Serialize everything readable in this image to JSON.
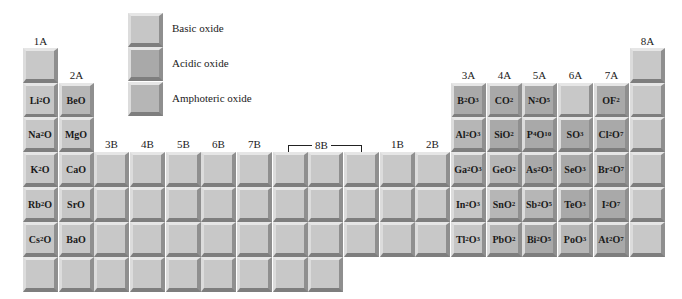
{
  "legend": {
    "basic": "Basic oxide",
    "acidic": "Acidic oxide",
    "amphoteric": "Amphoteric oxide"
  },
  "groups": {
    "1A": "1A",
    "2A": "2A",
    "3B": "3B",
    "4B": "4B",
    "5B": "5B",
    "6B": "6B",
    "7B": "7B",
    "8B": "8B",
    "1B": "1B",
    "2B": "2B",
    "3A": "3A",
    "4A": "4A",
    "5A": "5A",
    "6A": "6A",
    "7A": "7A",
    "8A": "8A"
  },
  "colors": {
    "basic": "#c6c6c6",
    "acidic": "#a9a9a9",
    "amphoteric": "#b6b6b6",
    "empty": "#c8c8c8"
  },
  "oxides": [
    {
      "id": "li2o",
      "html": "Li<sub>2</sub>O",
      "type": "basic",
      "col": 0,
      "row": 1
    },
    {
      "id": "beo",
      "html": "BeO",
      "type": "amph",
      "col": 1,
      "row": 1
    },
    {
      "id": "na2o",
      "html": "Na<sub>2</sub>O",
      "type": "basic",
      "col": 0,
      "row": 2
    },
    {
      "id": "mgo",
      "html": "MgO",
      "type": "basic",
      "col": 1,
      "row": 2
    },
    {
      "id": "k2o",
      "html": "K<sub>2</sub>O",
      "type": "basic",
      "col": 0,
      "row": 3
    },
    {
      "id": "cao",
      "html": "CaO",
      "type": "basic",
      "col": 1,
      "row": 3
    },
    {
      "id": "rb2o",
      "html": "Rb<sub>2</sub>O",
      "type": "basic",
      "col": 0,
      "row": 4
    },
    {
      "id": "sro",
      "html": "SrO",
      "type": "basic",
      "col": 1,
      "row": 4
    },
    {
      "id": "cs2o",
      "html": "Cs<sub>2</sub>O",
      "type": "basic",
      "col": 0,
      "row": 5
    },
    {
      "id": "bao",
      "html": "BaO",
      "type": "basic",
      "col": 1,
      "row": 5
    },
    {
      "id": "b2o3",
      "html": "B<sub>2</sub>O<sub>3</sub>",
      "type": "acidic",
      "col": 12,
      "row": 1
    },
    {
      "id": "co2",
      "html": "CO<sub>2</sub>",
      "type": "acidic",
      "col": 13,
      "row": 1
    },
    {
      "id": "n2o5",
      "html": "N<sub>2</sub>O<sub>5</sub>",
      "type": "acidic",
      "col": 14,
      "row": 1
    },
    {
      "id": "of2",
      "html": "OF<sub>2</sub>",
      "type": "acidic",
      "col": 16,
      "row": 1
    },
    {
      "id": "al2o3",
      "html": "Al<sub>2</sub>O<sub>3</sub>",
      "type": "amph",
      "col": 12,
      "row": 2
    },
    {
      "id": "sio2",
      "html": "SiO<sub>2</sub>",
      "type": "acidic",
      "col": 13,
      "row": 2
    },
    {
      "id": "p4o10",
      "html": "P<sub>4</sub>O<sub>10</sub>",
      "type": "acidic",
      "col": 14,
      "row": 2
    },
    {
      "id": "so3",
      "html": "SO<sub>3</sub>",
      "type": "acidic",
      "col": 15,
      "row": 2
    },
    {
      "id": "cl2o7",
      "html": "Cl<sub>2</sub>O<sub>7</sub>",
      "type": "acidic",
      "col": 16,
      "row": 2
    },
    {
      "id": "ga2o3",
      "html": "Ga<sub>2</sub>O<sub>3</sub>",
      "type": "amph",
      "col": 12,
      "row": 3
    },
    {
      "id": "geo2",
      "html": "GeO<sub>2</sub>",
      "type": "amph",
      "col": 13,
      "row": 3
    },
    {
      "id": "as2o5",
      "html": "As<sub>2</sub>O<sub>5</sub>",
      "type": "acidic",
      "col": 14,
      "row": 3
    },
    {
      "id": "seo3",
      "html": "SeO<sub>3</sub>",
      "type": "acidic",
      "col": 15,
      "row": 3
    },
    {
      "id": "br2o7",
      "html": "Br<sub>2</sub>O<sub>7</sub>",
      "type": "acidic",
      "col": 16,
      "row": 3
    },
    {
      "id": "in2o3",
      "html": "In<sub>2</sub>O<sub>3</sub>",
      "type": "basic",
      "col": 12,
      "row": 4
    },
    {
      "id": "sno2",
      "html": "SnO<sub>2</sub>",
      "type": "amph",
      "col": 13,
      "row": 4
    },
    {
      "id": "sb2o5",
      "html": "Sb<sub>2</sub>O<sub>5</sub>",
      "type": "amph",
      "col": 14,
      "row": 4
    },
    {
      "id": "teo3",
      "html": "TeO<sub>3</sub>",
      "type": "acidic",
      "col": 15,
      "row": 4
    },
    {
      "id": "i2o7",
      "html": "I<sub>2</sub>O<sub>7</sub>",
      "type": "acidic",
      "col": 16,
      "row": 4
    },
    {
      "id": "tl2o3",
      "html": "Tl<sub>2</sub>O<sub>3</sub>",
      "type": "basic",
      "col": 12,
      "row": 5
    },
    {
      "id": "pbo2",
      "html": "PbO<sub>2</sub>",
      "type": "amph",
      "col": 13,
      "row": 5
    },
    {
      "id": "bi2o5",
      "html": "Bi<sub>2</sub>O<sub>5</sub>",
      "type": "acidic",
      "col": 14,
      "row": 5
    },
    {
      "id": "poo3",
      "html": "PoO<sub>3</sub>",
      "type": "amph",
      "col": 15,
      "row": 5
    },
    {
      "id": "at2o7",
      "html": "At<sub>2</sub>O<sub>7</sub>",
      "type": "acidic",
      "col": 16,
      "row": 5
    }
  ]
}
